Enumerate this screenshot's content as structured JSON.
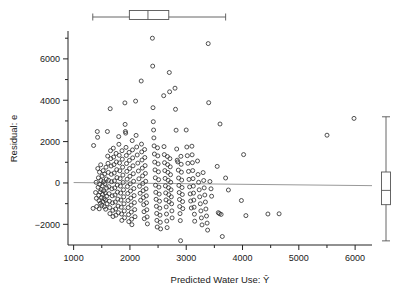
{
  "chart_data": {
    "type": "scatter",
    "title": "",
    "xlabel": "Predicted Water Use: Ŷ",
    "ylabel": "Residual: e",
    "xlim": [
      900,
      6300
    ],
    "ylim": [
      -3000,
      7300
    ],
    "xticks": [
      1000,
      2000,
      3000,
      4000,
      5000,
      6000
    ],
    "xtick_labels": [
      "1000",
      "2000",
      "3000",
      "4000",
      "5000",
      "6000"
    ],
    "xminor_ticks": [
      1500,
      2500,
      3500,
      4500,
      5500
    ],
    "yticks": [
      -2000,
      0,
      2000,
      4000,
      6000
    ],
    "ytick_labels": [
      "−2000",
      "0",
      "2000",
      "4000",
      "6000"
    ],
    "yminor_ticks": [
      -1000,
      1000,
      3000,
      5000,
      7000
    ],
    "grid": false,
    "legend": null,
    "marker": "open-circle",
    "marker_color": "#333333",
    "reference_line": {
      "label": "zero residual line",
      "color": "#999999",
      "x_start": 1000,
      "y_start": 20,
      "x_end": 6300,
      "y_end": -130
    },
    "marginal_boxplots": {
      "top": {
        "orientation": "horizontal",
        "variable": "Predicted Water Use",
        "min": 1340,
        "q1": 1990,
        "median": 2320,
        "q3": 2690,
        "max": 3700
      },
      "right": {
        "orientation": "vertical",
        "variable": "Residual",
        "min": -2800,
        "q1": -1050,
        "median": -360,
        "q3": 530,
        "max": 3200
      }
    },
    "points": [
      [
        1345,
        -1230
      ],
      [
        1355,
        1810
      ],
      [
        1390,
        -460
      ],
      [
        1400,
        30
      ],
      [
        1405,
        -740
      ],
      [
        1410,
        -1140
      ],
      [
        1420,
        2490
      ],
      [
        1425,
        2210
      ],
      [
        1430,
        700
      ],
      [
        1435,
        -210
      ],
      [
        1440,
        250
      ],
      [
        1445,
        -600
      ],
      [
        1450,
        -860
      ],
      [
        1455,
        -1250
      ],
      [
        1460,
        520
      ],
      [
        1465,
        -70
      ],
      [
        1470,
        -430
      ],
      [
        1475,
        -980
      ],
      [
        1480,
        880
      ],
      [
        1485,
        120
      ],
      [
        1490,
        -320
      ],
      [
        1495,
        -700
      ],
      [
        1500,
        -1080
      ],
      [
        1505,
        330
      ],
      [
        1510,
        -140
      ],
      [
        1515,
        -560
      ],
      [
        1520,
        -900
      ],
      [
        1525,
        600
      ],
      [
        1530,
        60
      ],
      [
        1535,
        -380
      ],
      [
        1540,
        -760
      ],
      [
        1545,
        -1150
      ],
      [
        1550,
        430
      ],
      [
        1555,
        -30
      ],
      [
        1560,
        -480
      ],
      [
        1565,
        -820
      ],
      [
        1570,
        -1270
      ],
      [
        1575,
        760
      ],
      [
        1580,
        190
      ],
      [
        1585,
        -250
      ],
      [
        1590,
        -640
      ],
      [
        1595,
        -1010
      ],
      [
        1600,
        2490
      ],
      [
        1605,
        1300
      ],
      [
        1610,
        950
      ],
      [
        1615,
        510
      ],
      [
        1620,
        130
      ],
      [
        1625,
        -180
      ],
      [
        1630,
        -520
      ],
      [
        1635,
        -880
      ],
      [
        1640,
        -1190
      ],
      [
        1645,
        -1480
      ],
      [
        1650,
        3590
      ],
      [
        1655,
        1560
      ],
      [
        1660,
        1180
      ],
      [
        1665,
        820
      ],
      [
        1670,
        420
      ],
      [
        1675,
        60
      ],
      [
        1680,
        -280
      ],
      [
        1685,
        -620
      ],
      [
        1690,
        -960
      ],
      [
        1695,
        -1320
      ],
      [
        1700,
        -1620
      ],
      [
        1705,
        1680
      ],
      [
        1710,
        1250
      ],
      [
        1715,
        890
      ],
      [
        1720,
        480
      ],
      [
        1725,
        100
      ],
      [
        1730,
        -240
      ],
      [
        1735,
        -580
      ],
      [
        1740,
        -920
      ],
      [
        1745,
        -1260
      ],
      [
        1750,
        -1560
      ],
      [
        1755,
        1430
      ],
      [
        1760,
        1020
      ],
      [
        1765,
        640
      ],
      [
        1770,
        260
      ],
      [
        1775,
        -100
      ],
      [
        1780,
        -440
      ],
      [
        1785,
        -780
      ],
      [
        1790,
        -1120
      ],
      [
        1795,
        -1440
      ],
      [
        1800,
        2240
      ],
      [
        1805,
        1870
      ],
      [
        1810,
        1340
      ],
      [
        1815,
        970
      ],
      [
        1820,
        590
      ],
      [
        1825,
        210
      ],
      [
        1830,
        -150
      ],
      [
        1835,
        -490
      ],
      [
        1840,
        -830
      ],
      [
        1845,
        -1170
      ],
      [
        1850,
        -1500
      ],
      [
        1855,
        -1810
      ],
      [
        1860,
        1560
      ],
      [
        1865,
        1150
      ],
      [
        1870,
        760
      ],
      [
        1875,
        380
      ],
      [
        1880,
        20
      ],
      [
        1885,
        -330
      ],
      [
        1890,
        -670
      ],
      [
        1895,
        -1010
      ],
      [
        1900,
        -1350
      ],
      [
        1905,
        -1680
      ],
      [
        1910,
        3870
      ],
      [
        1915,
        2830
      ],
      [
        1920,
        2490
      ],
      [
        1925,
        2410
      ],
      [
        1930,
        1720
      ],
      [
        1935,
        1330
      ],
      [
        1940,
        940
      ],
      [
        1945,
        560
      ],
      [
        1950,
        180
      ],
      [
        1955,
        -170
      ],
      [
        1960,
        -510
      ],
      [
        1965,
        -850
      ],
      [
        1970,
        -1190
      ],
      [
        1975,
        -1530
      ],
      [
        1980,
        -1870
      ],
      [
        1985,
        1480
      ],
      [
        1990,
        1090
      ],
      [
        1995,
        700
      ],
      [
        2000,
        320
      ],
      [
        2005,
        -40
      ],
      [
        2010,
        -390
      ],
      [
        2015,
        -730
      ],
      [
        2020,
        -1070
      ],
      [
        2025,
        -1410
      ],
      [
        2030,
        -1750
      ],
      [
        2035,
        -2020
      ],
      [
        2040,
        2050
      ],
      [
        2045,
        1600
      ],
      [
        2050,
        1210
      ],
      [
        2055,
        830
      ],
      [
        2060,
        450
      ],
      [
        2065,
        80
      ],
      [
        2070,
        -270
      ],
      [
        2075,
        -610
      ],
      [
        2080,
        -950
      ],
      [
        2085,
        -1290
      ],
      [
        2090,
        -1630
      ],
      [
        2100,
        3960
      ],
      [
        2110,
        2300
      ],
      [
        2120,
        1740
      ],
      [
        2130,
        1350
      ],
      [
        2140,
        960
      ],
      [
        2150,
        580
      ],
      [
        2160,
        200
      ],
      [
        2170,
        -160
      ],
      [
        2180,
        -500
      ],
      [
        2190,
        -840
      ],
      [
        2200,
        4930
      ],
      [
        2205,
        1880
      ],
      [
        2210,
        1500
      ],
      [
        2215,
        1110
      ],
      [
        2220,
        720
      ],
      [
        2225,
        340
      ],
      [
        2230,
        -20
      ],
      [
        2235,
        -370
      ],
      [
        2240,
        -710
      ],
      [
        2245,
        -1050
      ],
      [
        2250,
        -1390
      ],
      [
        2255,
        -1730
      ],
      [
        2260,
        1620
      ],
      [
        2265,
        1230
      ],
      [
        2270,
        840
      ],
      [
        2275,
        460
      ],
      [
        2280,
        80
      ],
      [
        2285,
        -280
      ],
      [
        2290,
        -620
      ],
      [
        2295,
        -960
      ],
      [
        2300,
        -1300
      ],
      [
        2305,
        -1640
      ],
      [
        2310,
        -1980
      ],
      [
        2400,
        7000
      ],
      [
        2405,
        5650
      ],
      [
        2410,
        3640
      ],
      [
        2415,
        2960
      ],
      [
        2420,
        2560
      ],
      [
        2425,
        2180
      ],
      [
        2430,
        1790
      ],
      [
        2435,
        1400
      ],
      [
        2440,
        1010
      ],
      [
        2445,
        630
      ],
      [
        2450,
        250
      ],
      [
        2455,
        -110
      ],
      [
        2460,
        -450
      ],
      [
        2465,
        -790
      ],
      [
        2470,
        -1130
      ],
      [
        2475,
        -1470
      ],
      [
        2480,
        -1810
      ],
      [
        2485,
        -2130
      ],
      [
        2490,
        1700
      ],
      [
        2495,
        1310
      ],
      [
        2500,
        920
      ],
      [
        2505,
        540
      ],
      [
        2510,
        160
      ],
      [
        2515,
        -200
      ],
      [
        2520,
        -540
      ],
      [
        2525,
        -880
      ],
      [
        2530,
        -1220
      ],
      [
        2535,
        -1560
      ],
      [
        2540,
        -1900
      ],
      [
        2545,
        -2220
      ],
      [
        2600,
        4220
      ],
      [
        2605,
        1760
      ],
      [
        2610,
        1370
      ],
      [
        2615,
        980
      ],
      [
        2620,
        600
      ],
      [
        2625,
        220
      ],
      [
        2630,
        -140
      ],
      [
        2635,
        -480
      ],
      [
        2640,
        -820
      ],
      [
        2645,
        -1160
      ],
      [
        2650,
        -1500
      ],
      [
        2655,
        -1840
      ],
      [
        2660,
        -2160
      ],
      [
        2665,
        1280
      ],
      [
        2670,
        890
      ],
      [
        2675,
        510
      ],
      [
        2680,
        130
      ],
      [
        2685,
        -230
      ],
      [
        2690,
        -570
      ],
      [
        2695,
        -910
      ],
      [
        2700,
        5340
      ],
      [
        2705,
        4410
      ],
      [
        2710,
        1180
      ],
      [
        2715,
        780
      ],
      [
        2720,
        400
      ],
      [
        2725,
        30
      ],
      [
        2730,
        -330
      ],
      [
        2735,
        -670
      ],
      [
        2740,
        -1010
      ],
      [
        2745,
        -1350
      ],
      [
        2750,
        -1690
      ],
      [
        2800,
        4580
      ],
      [
        2810,
        3560
      ],
      [
        2820,
        2550
      ],
      [
        2830,
        1640
      ],
      [
        2840,
        1100
      ],
      [
        2850,
        1020
      ],
      [
        2860,
        620
      ],
      [
        2865,
        240
      ],
      [
        2870,
        -120
      ],
      [
        2875,
        -460
      ],
      [
        2880,
        -800
      ],
      [
        2885,
        -1140
      ],
      [
        2890,
        -1480
      ],
      [
        2895,
        -1820
      ],
      [
        2900,
        -2790
      ],
      [
        2905,
        1290
      ],
      [
        2910,
        900
      ],
      [
        2915,
        520
      ],
      [
        2920,
        140
      ],
      [
        2925,
        -220
      ],
      [
        2930,
        -560
      ],
      [
        2935,
        -900
      ],
      [
        2940,
        -1240
      ],
      [
        3000,
        2560
      ],
      [
        3010,
        1740
      ],
      [
        3020,
        1320
      ],
      [
        3030,
        950
      ],
      [
        3040,
        560
      ],
      [
        3050,
        170
      ],
      [
        3060,
        -190
      ],
      [
        3070,
        -530
      ],
      [
        3080,
        -870
      ],
      [
        3090,
        -1210
      ],
      [
        3100,
        1780
      ],
      [
        3105,
        1360
      ],
      [
        3110,
        980
      ],
      [
        3115,
        600
      ],
      [
        3120,
        210
      ],
      [
        3125,
        -150
      ],
      [
        3130,
        -490
      ],
      [
        3135,
        -830
      ],
      [
        3140,
        -1170
      ],
      [
        3145,
        -1510
      ],
      [
        3150,
        -1850
      ],
      [
        3200,
        1060
      ],
      [
        3210,
        410
      ],
      [
        3220,
        30
      ],
      [
        3230,
        -330
      ],
      [
        3240,
        -670
      ],
      [
        3250,
        -1010
      ],
      [
        3260,
        -1350
      ],
      [
        3270,
        -1690
      ],
      [
        3280,
        -2030
      ],
      [
        3300,
        500
      ],
      [
        3310,
        120
      ],
      [
        3320,
        -240
      ],
      [
        3330,
        -580
      ],
      [
        3340,
        -920
      ],
      [
        3350,
        -1260
      ],
      [
        3360,
        -1600
      ],
      [
        3370,
        -1940
      ],
      [
        3380,
        -2280
      ],
      [
        3390,
        6740
      ],
      [
        3400,
        3880
      ],
      [
        3420,
        70
      ],
      [
        3440,
        -280
      ],
      [
        3450,
        -640
      ],
      [
        3550,
        800
      ],
      [
        3570,
        -1440
      ],
      [
        3590,
        -1480
      ],
      [
        3600,
        2850
      ],
      [
        3620,
        -1520
      ],
      [
        3640,
        -2590
      ],
      [
        3700,
        240
      ],
      [
        3750,
        -340
      ],
      [
        3980,
        -850
      ],
      [
        4020,
        1370
      ],
      [
        4060,
        -1580
      ],
      [
        4450,
        -1500
      ],
      [
        4650,
        -1490
      ],
      [
        5500,
        2310
      ],
      [
        5980,
        3120
      ]
    ]
  }
}
